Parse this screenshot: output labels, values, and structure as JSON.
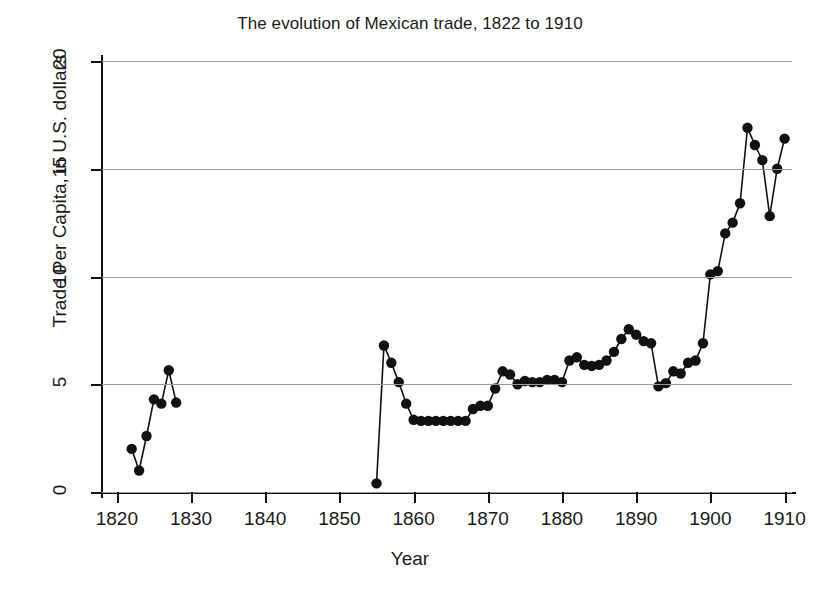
{
  "chart_data": {
    "type": "line",
    "title": "The evolution of Mexican trade, 1822 to 1910",
    "xlabel": "Year",
    "ylabel": "Trade Per Capita, in U.S. dollars",
    "xlim": [
      1818,
      1911
    ],
    "ylim": [
      0,
      20
    ],
    "xticks": [
      1820,
      1830,
      1840,
      1850,
      1860,
      1870,
      1880,
      1890,
      1900,
      1910
    ],
    "yticks": [
      0,
      5,
      10,
      15,
      20
    ],
    "grid": "horizontal",
    "legend": "none",
    "marker": "filled-circle",
    "line_color": "#111111",
    "grid_color": "#9a9a9a",
    "segments": [
      {
        "name": "1822-1828",
        "x": [
          1822,
          1823,
          1824,
          1825,
          1826,
          1827,
          1828
        ],
        "y": [
          2.0,
          1.0,
          2.6,
          4.3,
          4.1,
          5.65,
          4.15
        ]
      },
      {
        "name": "1855-1910",
        "x": [
          1855,
          1856,
          1857,
          1858,
          1859,
          1860,
          1861,
          1862,
          1863,
          1864,
          1865,
          1866,
          1867,
          1868,
          1869,
          1870,
          1871,
          1872,
          1873,
          1874,
          1875,
          1876,
          1877,
          1878,
          1879,
          1880,
          1881,
          1882,
          1883,
          1884,
          1885,
          1886,
          1887,
          1888,
          1889,
          1890,
          1891,
          1892,
          1893,
          1894,
          1895,
          1896,
          1897,
          1898,
          1899,
          1900,
          1901,
          1902,
          1903,
          1904,
          1905,
          1906,
          1907,
          1908,
          1909,
          1910
        ],
        "y": [
          0.4,
          6.8,
          6.0,
          5.1,
          4.1,
          3.35,
          3.3,
          3.3,
          3.3,
          3.3,
          3.3,
          3.3,
          3.3,
          3.85,
          4.0,
          4.0,
          4.8,
          5.6,
          5.45,
          5.0,
          5.15,
          5.1,
          5.1,
          5.2,
          5.2,
          5.1,
          6.1,
          6.25,
          5.9,
          5.85,
          5.9,
          6.1,
          6.5,
          7.1,
          7.55,
          7.3,
          7.0,
          6.9,
          4.9,
          5.05,
          5.6,
          5.5,
          6.0,
          6.1,
          6.9,
          10.1,
          10.25,
          12.0,
          12.5,
          13.4,
          16.9,
          16.1,
          15.4,
          12.8,
          15.0,
          16.4
        ]
      }
    ]
  }
}
